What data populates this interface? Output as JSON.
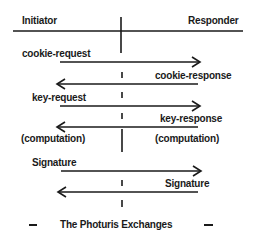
{
  "header": {
    "initiator": "Initiator",
    "responder": "Responder"
  },
  "messages": [
    {
      "label": "cookie-request",
      "direction": "right"
    },
    {
      "label": "cookie-response",
      "direction": "left"
    },
    {
      "label": "key-request",
      "direction": "right"
    },
    {
      "label": "key-response",
      "direction": "left"
    }
  ],
  "computation": {
    "initiator": "(computation)",
    "responder": "(computation)"
  },
  "signature": [
    {
      "label": "Signature",
      "direction": "right"
    },
    {
      "label": "Signature",
      "direction": "left"
    }
  ],
  "caption": "The Photuris Exchanges",
  "colors": {
    "ink": "#1a1a1a",
    "background": "#ffffff"
  }
}
